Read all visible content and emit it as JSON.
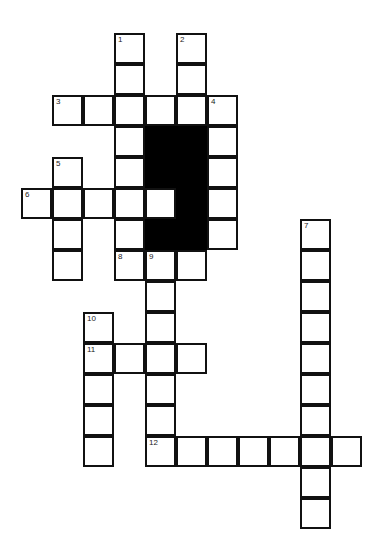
{
  "puzzle": {
    "type": "crossword",
    "cell_size": 31,
    "origin": {
      "x": 22,
      "y": 34
    },
    "entries": [
      {
        "number": "1",
        "direction": "down",
        "row": 0,
        "col": 3,
        "length": 8
      },
      {
        "number": "2",
        "direction": "down",
        "row": 0,
        "col": 5,
        "length": 3
      },
      {
        "number": "3",
        "direction": "across",
        "row": 2,
        "col": 1,
        "length": 6
      },
      {
        "number": "4",
        "direction": "down",
        "row": 2,
        "col": 6,
        "length": 5
      },
      {
        "number": "5",
        "direction": "down",
        "row": 4,
        "col": 1,
        "length": 4
      },
      {
        "number": "6",
        "direction": "across",
        "row": 5,
        "col": 0,
        "length": 5
      },
      {
        "number": "7",
        "direction": "down",
        "row": 6,
        "col": 9,
        "length": 10
      },
      {
        "number": "8",
        "direction": "across",
        "row": 7,
        "col": 3,
        "length": 3
      },
      {
        "number": "9",
        "direction": "down",
        "row": 7,
        "col": 4,
        "length": 7
      },
      {
        "number": "10",
        "direction": "down",
        "row": 9,
        "col": 2,
        "length": 5
      },
      {
        "number": "11",
        "direction": "across",
        "row": 10,
        "col": 2,
        "length": 4
      },
      {
        "number": "12",
        "direction": "across",
        "row": 13,
        "col": 4,
        "length": 7
      }
    ],
    "black_cells": [
      [
        3,
        4
      ],
      [
        3,
        5
      ],
      [
        4,
        4
      ],
      [
        4,
        5
      ],
      [
        5,
        5
      ],
      [
        6,
        4
      ],
      [
        6,
        5
      ]
    ]
  }
}
